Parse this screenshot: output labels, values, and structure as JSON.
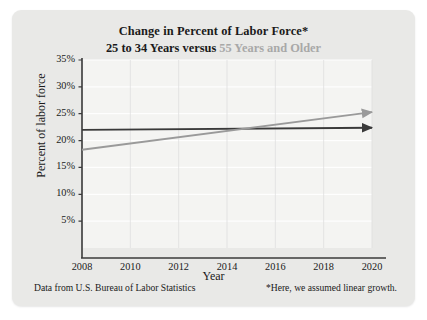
{
  "card": {
    "background_color": "#e9e9e7"
  },
  "title": {
    "line1": "Change in Percent of Labor Force*",
    "line2_part1": "25 to 34 Years ",
    "line2_part2": "versus ",
    "line2_part3": "55 Years and Older"
  },
  "footer": {
    "source": "Data from U.S. Bureau of Labor Statistics",
    "assumption": "*Here, we assumed linear growth."
  },
  "chart_data": {
    "type": "line",
    "title": "Change in Percent of Labor Force*",
    "subtitle": "25 to 34 Years versus 55 Years and Older",
    "xlabel": "Year",
    "ylabel": "Percent of labor force",
    "xlim": [
      2008,
      2020
    ],
    "ylim": [
      0,
      35
    ],
    "xticks": [
      2008,
      2010,
      2012,
      2014,
      2016,
      2018,
      2020
    ],
    "xticklabels": [
      "2008",
      "2010",
      "2012",
      "2014",
      "2016",
      "2018",
      "2020"
    ],
    "yticks": [
      5,
      10,
      15,
      20,
      25,
      30,
      35
    ],
    "yticklabels": [
      "5%",
      "10%",
      "15%",
      "20%",
      "25%",
      "30%",
      "35%"
    ],
    "grid": true,
    "grid_color": "#ffffff",
    "plot_background": "#f4f4f2",
    "legend": "in-title",
    "legend_position": "none",
    "series": [
      {
        "name": "25 to 34 Years",
        "color": "#3a3a3a",
        "arrow_end": true,
        "x": [
          2008,
          2020
        ],
        "values": [
          22.0,
          22.4
        ]
      },
      {
        "name": "55 Years and Older",
        "color": "#9a9a9a",
        "arrow_end": true,
        "x": [
          2008,
          2020
        ],
        "values": [
          18.3,
          25.3
        ]
      }
    ],
    "annotations": [
      {
        "text": "lines cross",
        "x": 2014.7,
        "y": 22.2
      }
    ]
  }
}
